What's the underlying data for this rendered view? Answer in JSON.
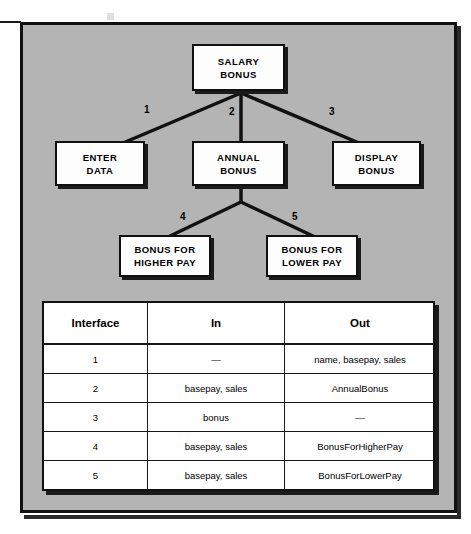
{
  "figure": {
    "type": "structure-chart",
    "background_color": "#b4b4b4",
    "line_color": "#111111",
    "node_fill": "#fdfdfd"
  },
  "diagram": {
    "nodes": [
      {
        "id": "salary-bonus",
        "line1": "SALARY",
        "line2": "BONUS"
      },
      {
        "id": "enter-data",
        "line1": "ENTER",
        "line2": "DATA"
      },
      {
        "id": "annual-bonus",
        "line1": "ANNUAL",
        "line2": "BONUS"
      },
      {
        "id": "display-bonus",
        "line1": "DISPLAY",
        "line2": "BONUS"
      },
      {
        "id": "bonus-higher-pay",
        "line1": "BONUS FOR",
        "line2": "HIGHER PAY"
      },
      {
        "id": "bonus-lower-pay",
        "line1": "BONUS FOR",
        "line2": "LOWER PAY"
      }
    ],
    "edge_labels": [
      {
        "id": "edge-1",
        "label": "1"
      },
      {
        "id": "edge-2",
        "label": "2"
      },
      {
        "id": "edge-3",
        "label": "3"
      },
      {
        "id": "edge-4",
        "label": "4"
      },
      {
        "id": "edge-5",
        "label": "5"
      }
    ]
  },
  "table": {
    "headers": [
      "Interface",
      "In",
      "Out"
    ],
    "rows": [
      {
        "interface": "1",
        "in": "—",
        "out": "name, basepay, sales"
      },
      {
        "interface": "2",
        "in": "basepay, sales",
        "out": "AnnualBonus"
      },
      {
        "interface": "3",
        "in": "bonus",
        "out": "—"
      },
      {
        "interface": "4",
        "in": "basepay, sales",
        "out": "BonusForHigherPay"
      },
      {
        "interface": "5",
        "in": "basepay, sales",
        "out": "BonusForLowerPay"
      }
    ]
  }
}
